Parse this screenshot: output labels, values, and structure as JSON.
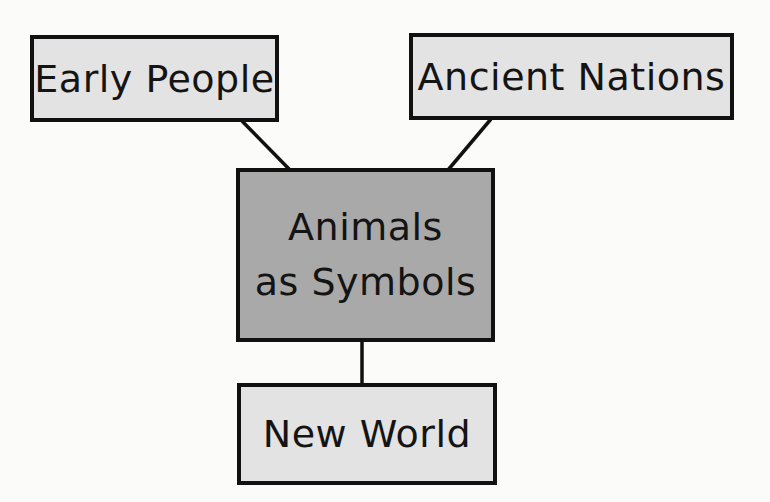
{
  "diagram": {
    "type": "concept-web",
    "colors": {
      "background": "#fbfbfa",
      "outer_node_fill": "#e3e3e3",
      "center_node_fill": "#a9a9a9",
      "border": "#111111",
      "text": "#141414"
    },
    "nodes": {
      "early_people": {
        "label": "Early People"
      },
      "ancient_nations": {
        "label": "Ancient Nations"
      },
      "center": {
        "line1": "Animals",
        "line2": "as Symbols"
      },
      "new_world": {
        "label": "New World"
      }
    },
    "edges": [
      {
        "from": "center",
        "to": "early_people"
      },
      {
        "from": "center",
        "to": "ancient_nations"
      },
      {
        "from": "center",
        "to": "new_world"
      }
    ]
  }
}
